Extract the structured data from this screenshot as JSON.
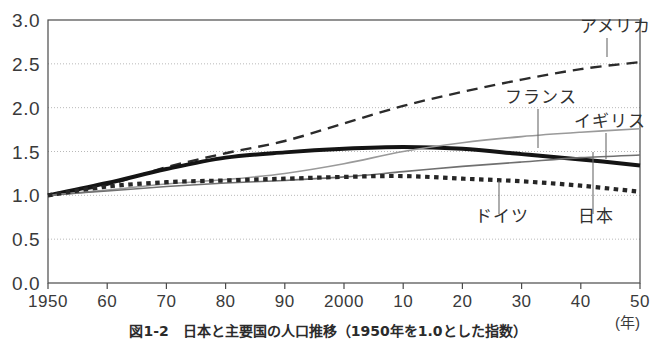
{
  "figure": {
    "caption": "図1-2　日本と主要国の人口推移（1950年を1.0とした指数）",
    "caption_visible_fragment": "図1-2　日本と主要国の人口推移"
  },
  "chart_data": {
    "type": "line",
    "title": "",
    "xlabel": "(年)",
    "ylabel": "",
    "xlim": [
      1950,
      2050
    ],
    "ylim": [
      0.0,
      3.0
    ],
    "grid": true,
    "legend_position": "inline-annotations",
    "x_tick_labels": [
      "1950",
      "60",
      "70",
      "80",
      "90",
      "2000",
      "10",
      "20",
      "30",
      "40",
      "50"
    ],
    "x_tick_values": [
      1950,
      1960,
      1970,
      1980,
      1990,
      2000,
      2010,
      2020,
      2030,
      2040,
      2050
    ],
    "y_tick_labels": [
      "0.0",
      "0.5",
      "1.0",
      "1.5",
      "2.0",
      "2.5",
      "3.0"
    ],
    "y_tick_values": [
      0.0,
      0.5,
      1.0,
      1.5,
      2.0,
      2.5,
      3.0
    ],
    "x": [
      1950,
      1960,
      1970,
      1980,
      1990,
      2000,
      2010,
      2020,
      2030,
      2040,
      2050
    ],
    "series": [
      {
        "name": "アメリカ",
        "name_en": "United States",
        "style": "dashed",
        "color": "#2b2b2b",
        "width": 2.4,
        "values": [
          1.0,
          1.12,
          1.32,
          1.48,
          1.62,
          1.82,
          2.02,
          2.18,
          2.32,
          2.44,
          2.52
        ]
      },
      {
        "name": "フランス",
        "name_en": "France",
        "style": "solid-thick",
        "color": "#141414",
        "width": 4.0,
        "values": [
          1.0,
          1.14,
          1.3,
          1.43,
          1.49,
          1.53,
          1.55,
          1.53,
          1.47,
          1.41,
          1.34
        ]
      },
      {
        "name": "イギリス",
        "name_en": "United Kingdom",
        "style": "solid-light",
        "color": "#9a9a9a",
        "width": 1.6,
        "values": [
          1.0,
          1.06,
          1.13,
          1.18,
          1.25,
          1.36,
          1.5,
          1.6,
          1.67,
          1.72,
          1.76
        ]
      },
      {
        "name": "ドイツ",
        "name_en": "Germany",
        "style": "solid-gray",
        "color": "#707070",
        "width": 1.6,
        "values": [
          1.0,
          1.05,
          1.1,
          1.14,
          1.17,
          1.21,
          1.27,
          1.33,
          1.38,
          1.43,
          1.46
        ]
      },
      {
        "name": "日本",
        "name_en": "Japan",
        "style": "dotted-thick",
        "color": "#262626",
        "width": 4.2,
        "values": [
          1.0,
          1.1,
          1.15,
          1.17,
          1.19,
          1.21,
          1.22,
          1.19,
          1.16,
          1.11,
          1.04
        ]
      }
    ],
    "annotations": [
      {
        "label": "アメリカ",
        "label_x": 580,
        "label_y": 32,
        "leader_x": 607,
        "leader_y1": 38,
        "leader_y2": 57
      },
      {
        "label": "フランス",
        "label_x": 505,
        "label_y": 103,
        "leader_x": 538,
        "leader_y1": 109,
        "leader_y2": 148
      },
      {
        "label": "イギリス",
        "label_x": 574,
        "label_y": 127,
        "leader_x": 606,
        "leader_y1": 133,
        "leader_y2": 159
      },
      {
        "label": "ドイツ",
        "label_x": 475,
        "label_y": 222,
        "leader_x": 499,
        "leader_y1": 181,
        "leader_y2": 214
      },
      {
        "label": "日本",
        "label_x": 578,
        "label_y": 222,
        "leader_x": 593,
        "leader_y1": 152,
        "leader_y2": 214
      }
    ]
  },
  "colors": {
    "background": "#ffffff",
    "axis": "#4a4a4a",
    "grid": "#b9b9b9",
    "text": "#2b2b2b"
  }
}
